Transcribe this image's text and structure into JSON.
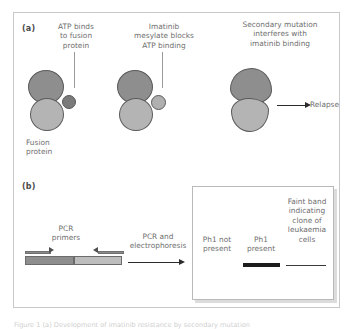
{
  "figure": {
    "panel_a": {
      "label": "(a)",
      "callouts": [
        {
          "text": "ATP binds\nto fusion\nprotein"
        },
        {
          "text": "Imatinib\nmesylate blocks\nATP binding"
        },
        {
          "text": "Secondary mutation\ninterferes with\nimatinib binding"
        }
      ],
      "fusion_protein_label": "Fusion\nprotein",
      "outcome_label": "Relapse",
      "colors": {
        "lobe_top": "#8e8e8e",
        "lobe_bottom": "#b4b4b4",
        "atp": "#7b7b7b",
        "imatinib": "#b0b0b0",
        "outline": "#5a5a5a"
      }
    },
    "panel_b": {
      "label": "(b)",
      "primers_label": "PCR\nprimers",
      "process_label": "PCR and\nelectrophoresis",
      "gel": {
        "lanes": [
          {
            "label": "Ph1 not\npresent",
            "band": "none"
          },
          {
            "label": "Ph1\npresent",
            "band": "thick"
          },
          {
            "label": "Faint band\nindicating\nclone of\nleukaemia\ncells",
            "band": "thin"
          }
        ]
      },
      "colors": {
        "dna_left": "#8e8e8e",
        "dna_right": "#bdbdbd",
        "band": "#1c1c1c"
      }
    },
    "bottom_caption": "Figure 1 (a) Development of imatinib resistance by secondary mutation"
  }
}
